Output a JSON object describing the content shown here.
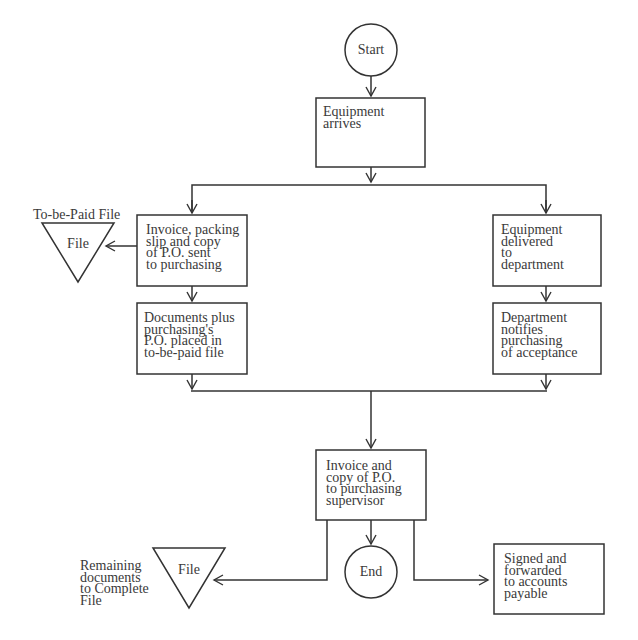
{
  "diagram": {
    "type": "flowchart",
    "nodes": {
      "start": {
        "shape": "circle",
        "label": "Start"
      },
      "equipment_arrives": {
        "shape": "box",
        "label": "Equipment\narrives"
      },
      "invoice_packing_slip": {
        "shape": "box",
        "label": "Invoice, packing\nslip and copy\nof P.O. sent\nto purchasing"
      },
      "to_be_paid_file": {
        "shape": "triangle",
        "label": "File",
        "caption": "To-be-Paid File"
      },
      "documents_plus": {
        "shape": "box",
        "label": "Documents plus\npurchasing's\nP.O. placed in\nto-be-paid file"
      },
      "equipment_delivered": {
        "shape": "box",
        "label": "Equipment\ndelivered\nto\ndepartment"
      },
      "department_notifies": {
        "shape": "box",
        "label": "Department\nnotifies\npurchasing\nof acceptance"
      },
      "invoice_and_copy": {
        "shape": "box",
        "label": "Invoice and\ncopy of P.O.\nto purchasing\nsupervisor"
      },
      "end": {
        "shape": "circle",
        "label": "End"
      },
      "complete_file": {
        "shape": "triangle",
        "label": "File",
        "caption": "Remaining\ndocuments\nto Complete\nFile"
      },
      "signed_forwarded": {
        "shape": "box",
        "label": "Signed and\nforwarded\nto accounts\npayable"
      }
    },
    "edges": [
      {
        "from": "start",
        "to": "equipment_arrives"
      },
      {
        "from": "equipment_arrives",
        "to": "invoice_packing_slip"
      },
      {
        "from": "equipment_arrives",
        "to": "equipment_delivered"
      },
      {
        "from": "invoice_packing_slip",
        "to": "to_be_paid_file"
      },
      {
        "from": "invoice_packing_slip",
        "to": "documents_plus"
      },
      {
        "from": "equipment_delivered",
        "to": "department_notifies"
      },
      {
        "from": "documents_plus",
        "to": "invoice_and_copy"
      },
      {
        "from": "department_notifies",
        "to": "invoice_and_copy"
      },
      {
        "from": "invoice_and_copy",
        "to": "end"
      },
      {
        "from": "invoice_and_copy",
        "to": "complete_file"
      },
      {
        "from": "invoice_and_copy",
        "to": "signed_forwarded"
      }
    ]
  }
}
